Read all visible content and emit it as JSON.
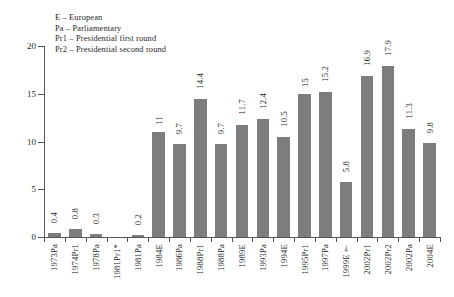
{
  "legend": {
    "lines": [
      "E – European",
      "Pa – Parliamentary",
      "Pr1 – Presidential first round",
      "Pr2 – Presidential second round"
    ]
  },
  "axis": {
    "y_ticks": [
      "0",
      "5",
      "10",
      "15",
      "20"
    ]
  },
  "colors": {
    "bar": "#7d7d7d",
    "axis": "#555555",
    "text": "#262626",
    "background": "#ffffff"
  },
  "chart_data": {
    "type": "bar",
    "title": "",
    "xlabel": "",
    "ylabel": "",
    "ylim": [
      0,
      20
    ],
    "ytick_values": [
      0,
      5,
      10,
      15,
      20
    ],
    "grid": false,
    "legend_position": "top-left",
    "categories": [
      "1973Pa",
      "1974Pr1",
      "1978Pa",
      "1981Pr1*",
      "1981Pa",
      "1984E",
      "1986Pa",
      "1988Pr1",
      "1988Pa",
      "1989E",
      "1993Pa",
      "1994E",
      "1995Pr1",
      "1997Pa",
      "1999E†",
      "2002Pr1",
      "2002Pr2",
      "2002Pa",
      "2004E"
    ],
    "values": [
      0.4,
      0.8,
      0.3,
      0,
      0.2,
      11,
      9.7,
      14.4,
      9.7,
      11.7,
      12.4,
      10.5,
      15,
      15.2,
      5.8,
      16.9,
      17.9,
      11.3,
      9.8
    ],
    "value_labels": [
      "0.4",
      "0.8",
      "0.3",
      "",
      "0.2",
      "11",
      "9.7",
      "14.4",
      "9.7",
      "11.7",
      "12.4",
      "10.5",
      "15",
      "15.2",
      "5.8",
      "16.9",
      "17.9",
      "11.3",
      "9.8"
    ],
    "annotations": [
      "E – European",
      "Pa – Parliamentary",
      "Pr1 – Presidential first round",
      "Pr2 – Presidential second round"
    ]
  }
}
